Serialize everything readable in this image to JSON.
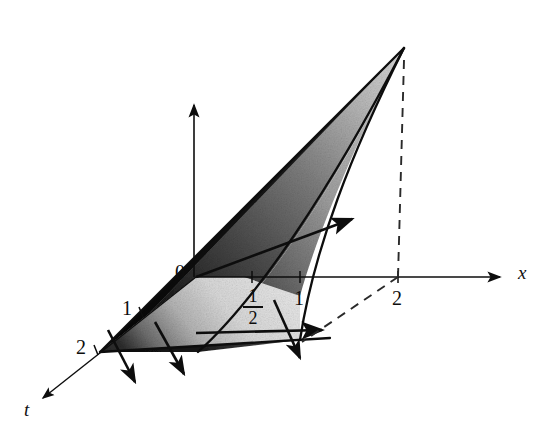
{
  "figure": {
    "kind": "math-3d-diagram",
    "background_color": "#ffffff",
    "ink_color": "#0d0d0d",
    "description_axes": [
      "x",
      "t",
      "u"
    ],
    "axes": [
      {
        "name": "x-axis",
        "label": "x",
        "label_style": "italic",
        "direction": "right",
        "arrow": true
      },
      {
        "name": "t-axis",
        "label": "t",
        "label_style": "italic",
        "direction": "down-left",
        "arrow": true
      },
      {
        "name": "vertical-axis",
        "label": "",
        "direction": "up",
        "arrow": true
      }
    ],
    "labels": {
      "origin": "0",
      "x_axis_name": "x",
      "t_axis_name": "t",
      "x_tick_half_numerator": "1",
      "x_tick_half_denominator": "2",
      "x_tick_one": "1",
      "x_tick_two": "2",
      "t_tick_one": "1",
      "t_tick_two": "2"
    },
    "ticks": {
      "x": [
        "1/2",
        "1",
        "2"
      ],
      "t": [
        "1",
        "2"
      ]
    },
    "shading": {
      "type": "grayscale-gradient",
      "dark_color": "#111111",
      "mid_color": "#8a8a8a",
      "light_color": "#e2e2e2"
    },
    "elements": {
      "characteristic_arrows_count": 6,
      "dashed_guides_count": 2,
      "solid_boundary_curves": 3
    }
  }
}
